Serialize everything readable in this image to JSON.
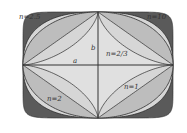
{
  "diagram": {
    "center": {
      "x": 98,
      "y": 65
    },
    "a": 75,
    "b": 53,
    "colors": {
      "outer_fill": "#5a5a5a",
      "ellipse_fill": "#d6d6d6",
      "lens_fill": "#bdbdbd",
      "astroid_fill": "#e0e0e0",
      "stroke": "#2b2b2b",
      "axis": "#333333"
    },
    "curves": [
      {
        "n": 10,
        "label": "n=10"
      },
      {
        "n": 2.5,
        "label": "n=2.5"
      },
      {
        "n": 2,
        "label": "n=2"
      },
      {
        "n": 1,
        "label": "n=1"
      },
      {
        "n": 0.6667,
        "label": "n=2/3"
      }
    ],
    "labels": {
      "n10": "n=10",
      "n25": "n=2.5",
      "n2": "n=2",
      "n1": "n=1",
      "n23": "n=2/3",
      "a": "a",
      "b": "b"
    }
  }
}
